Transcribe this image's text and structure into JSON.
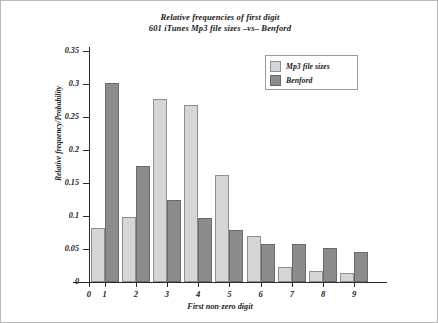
{
  "chart_data": {
    "type": "bar",
    "title": "Relative frequencies of first digit",
    "subtitle": "601 iTunes Mp3 file sizes –vs– Benford",
    "xlabel": "First non-zero digit",
    "ylabel": "Relative frequency/Probability",
    "categories": [
      "1",
      "2",
      "3",
      "4",
      "5",
      "6",
      "7",
      "8",
      "9"
    ],
    "x_tick_labels": [
      "0",
      "1",
      "2",
      "3",
      "4",
      "5",
      "6",
      "7",
      "8",
      "9"
    ],
    "y_tick_labels": [
      "0",
      "0.05",
      "0.1",
      "0.15",
      "0.2",
      "0.25",
      "0.3",
      "0.35"
    ],
    "y_tick_values": [
      0,
      0.05,
      0.1,
      0.15,
      0.2,
      0.25,
      0.3,
      0.35
    ],
    "ylim": [
      0,
      0.35
    ],
    "grid": false,
    "legend_position": "top-right",
    "series": [
      {
        "name": "Mp3 file sizes",
        "color": "#d6d6d6",
        "edge_color": "#8f8f8f",
        "values": [
          0.082,
          0.099,
          0.277,
          0.268,
          0.162,
          0.07,
          0.023,
          0.017,
          0.013
        ]
      },
      {
        "name": "Benford",
        "color": "#8c8c8c",
        "edge_color": "#6a6a6a",
        "values": [
          0.301,
          0.176,
          0.125,
          0.097,
          0.079,
          0.058,
          0.058,
          0.051,
          0.046
        ]
      }
    ]
  },
  "legend": {
    "entries": [
      {
        "label": "Mp3 file sizes",
        "style": "light"
      },
      {
        "label": "Benford",
        "style": "dark"
      }
    ]
  }
}
